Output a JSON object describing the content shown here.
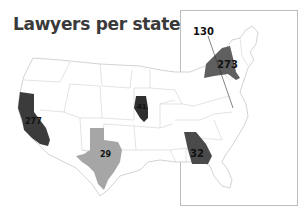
{
  "title": "Lawyers per state",
  "colors": {
    "dark": "#3b3b3b",
    "medium": "#5f5f5f",
    "light": "#a6a6a6",
    "outline": "#c8c8c8",
    "frame": "#bdbdbd"
  },
  "states": [
    {
      "name": "California",
      "value": "277"
    },
    {
      "name": "Texas",
      "value": "29"
    },
    {
      "name": "Illinois",
      "value": "41"
    },
    {
      "name": "Georgia",
      "value": "32"
    },
    {
      "name": "New York",
      "value": "273"
    },
    {
      "name": "District of Columbia",
      "value": "130"
    }
  ]
}
